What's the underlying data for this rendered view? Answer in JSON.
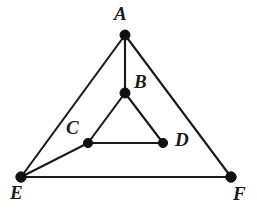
{
  "figure": {
    "background_color": "#ffffff",
    "line_color": "#1a1a1a",
    "vertex_color": "#111111",
    "canvas": {
      "width": 257,
      "height": 214
    },
    "vertices": [
      {
        "id": "A",
        "label": "A",
        "x": 125,
        "y": 35,
        "label_x": 114,
        "label_y": 4,
        "dot_radius": 5.0
      },
      {
        "id": "B",
        "label": "B",
        "x": 125,
        "y": 93,
        "label_x": 134,
        "label_y": 72,
        "dot_radius": 5.0
      },
      {
        "id": "C",
        "label": "C",
        "x": 88,
        "y": 143,
        "label_x": 66,
        "label_y": 118,
        "dot_radius": 4.6
      },
      {
        "id": "D",
        "label": "D",
        "x": 163,
        "y": 143,
        "label_x": 175,
        "label_y": 130,
        "dot_radius": 4.6
      },
      {
        "id": "E",
        "label": "E",
        "x": 21,
        "y": 177,
        "label_x": 10,
        "label_y": 183,
        "dot_radius": 5.2
      },
      {
        "id": "F",
        "label": "F",
        "x": 231,
        "y": 177,
        "label_x": 233,
        "label_y": 184,
        "dot_radius": 5.2
      }
    ],
    "edges": [
      {
        "name": "edge-A-E",
        "from": "A",
        "to": "E"
      },
      {
        "name": "edge-A-F",
        "from": "A",
        "to": "F"
      },
      {
        "name": "edge-E-F",
        "from": "E",
        "to": "F"
      },
      {
        "name": "edge-A-B",
        "from": "A",
        "to": "B"
      },
      {
        "name": "edge-B-C",
        "from": "B",
        "to": "C"
      },
      {
        "name": "edge-B-D",
        "from": "B",
        "to": "D"
      },
      {
        "name": "edge-C-D",
        "from": "C",
        "to": "D"
      },
      {
        "name": "edge-E-C",
        "from": "E",
        "to": "C"
      }
    ]
  }
}
